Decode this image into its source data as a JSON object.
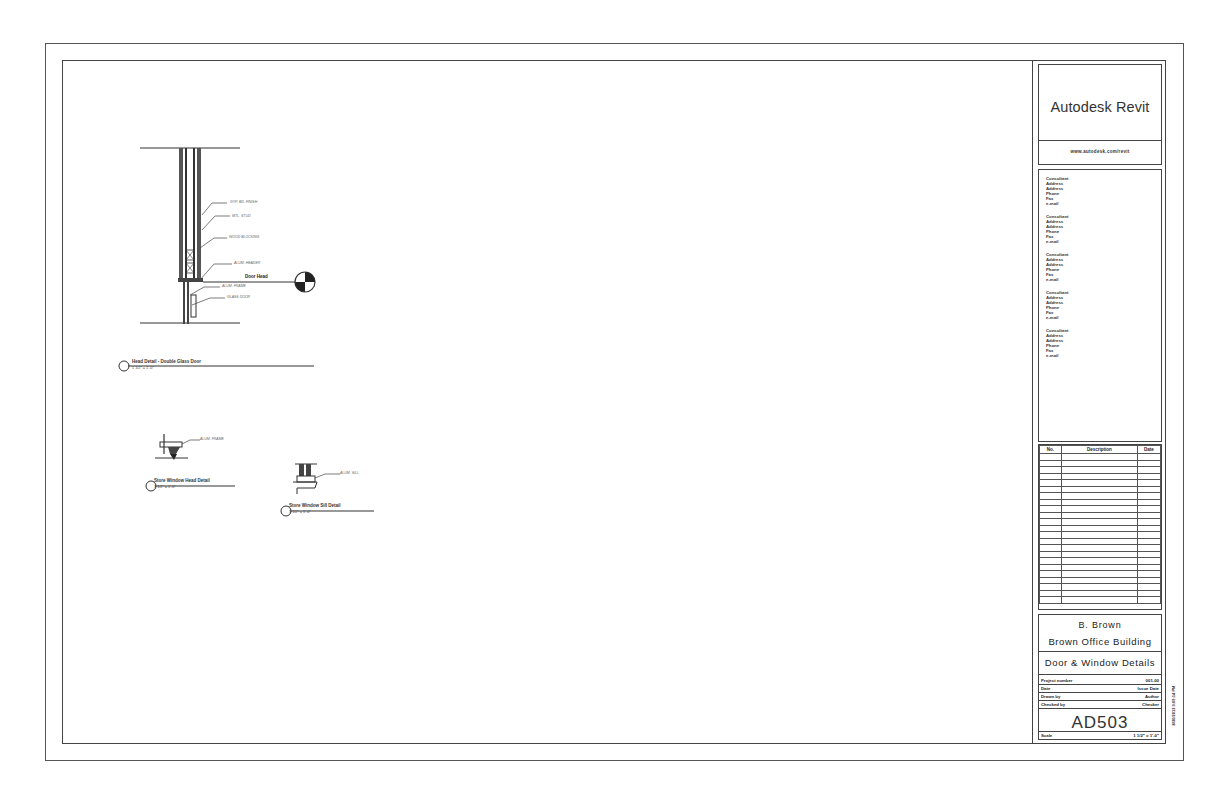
{
  "sheet": {
    "logo": "Autodesk Revit",
    "logo_subtitle": "www.autodesk.com/revit",
    "consultants": [
      {
        "name": "Consultant",
        "address1": "Address",
        "address2": "Address",
        "phone": "Phone",
        "fax": "Fax",
        "email": "e-mail"
      },
      {
        "name": "Consultant",
        "address1": "Address",
        "address2": "Address",
        "phone": "Phone",
        "fax": "Fax",
        "email": "e-mail"
      },
      {
        "name": "Consultant",
        "address1": "Address",
        "address2": "Address",
        "phone": "Phone",
        "fax": "Fax",
        "email": "e-mail"
      },
      {
        "name": "Consultant",
        "address1": "Address",
        "address2": "Address",
        "phone": "Phone",
        "fax": "Fax",
        "email": "e-mail"
      },
      {
        "name": "Consultant",
        "address1": "Address",
        "address2": "Address",
        "phone": "Phone",
        "fax": "Fax",
        "email": "e-mail"
      }
    ],
    "revision_table": {
      "headers": [
        "No.",
        "Description",
        "Date"
      ],
      "empty_rows": 23
    },
    "client": "B. Brown",
    "project_name": "Brown Office Building",
    "sheet_title": "Door & Window Details",
    "info": [
      {
        "label": "Project number",
        "value": "001-00"
      },
      {
        "label": "Date",
        "value": "Issue Date"
      },
      {
        "label": "Drawn by",
        "value": "Author"
      },
      {
        "label": "Checked by",
        "value": "Checker"
      }
    ],
    "sheet_number": "AD503",
    "scale_label": "Scale",
    "scale_value": "1 1/2\" = 1'-0\"",
    "vertical_stamp": "8/30/2013 3:09:14 PM"
  },
  "details": {
    "head_detail": {
      "number": "1",
      "title": "Head Detail - Double Glass Door",
      "scale": "1 1/2\" = 1'-0\"",
      "level_name": "Door Head",
      "notes": [
        "GYP. BD. FINISH",
        "MTL. STUD",
        "WOOD BLOCKING",
        "ALUM. HEADER",
        "ALUM. FRAME",
        "GLASS DOOR"
      ]
    },
    "window_head": {
      "number": "2",
      "title": "Store Window Head Detail",
      "scale": "1 1/2\" = 1'-0\"",
      "notes": [
        "ALUM. FRAME"
      ]
    },
    "window_sill": {
      "number": "3",
      "title": "Store Window Sill Detail",
      "scale": "1 1/2\" = 1'-0\"",
      "notes": [
        "ALUM. SILL"
      ]
    }
  }
}
